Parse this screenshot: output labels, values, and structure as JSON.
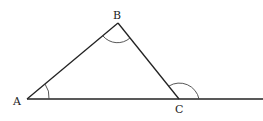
{
  "diagram": {
    "type": "triangle-exterior-angle",
    "points": {
      "A": {
        "label": "A",
        "x": 27,
        "y": 99
      },
      "B": {
        "label": "B",
        "x": 118,
        "y": 23
      },
      "C": {
        "label": "C",
        "x": 179,
        "y": 99
      }
    },
    "extended_line_end_x": 263,
    "angle_marks": [
      "A",
      "B",
      "exterior-C"
    ],
    "colors": {
      "stroke": "#222222",
      "background": "#ffffff"
    }
  }
}
